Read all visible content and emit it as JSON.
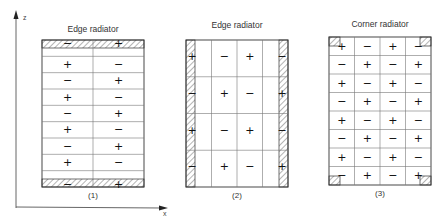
{
  "axes": {
    "z_label": "z",
    "x_label": "x"
  },
  "panels": [
    {
      "title": "Edge radiator",
      "caption": "(1)",
      "box": {
        "x": 42,
        "y": 40,
        "w": 102,
        "h": 147
      },
      "layout": "rows",
      "hatched": [
        "top",
        "bottom"
      ],
      "rows": 9,
      "cols": 2,
      "signs": [
        [
          "−",
          "+"
        ],
        [
          "+",
          "−"
        ],
        [
          "−",
          "+"
        ],
        [
          "+",
          "−"
        ],
        [
          "−",
          "+"
        ],
        [
          "+",
          "−"
        ],
        [
          "−",
          "+"
        ],
        [
          "+",
          "−"
        ],
        [
          "−",
          "+"
        ]
      ]
    },
    {
      "title": "Edge radiator",
      "caption": "(2)",
      "box": {
        "x": 186,
        "y": 40,
        "w": 102,
        "h": 147
      },
      "layout": "cols",
      "hatched": [
        "left",
        "right"
      ],
      "rows": 4,
      "cols": 4,
      "signs": [
        [
          "+",
          "−",
          "+",
          "−"
        ],
        [
          "−",
          "+",
          "−",
          "+"
        ],
        [
          "+",
          "−",
          "+",
          "−"
        ],
        [
          "−",
          "+",
          "−",
          "+"
        ]
      ]
    },
    {
      "title": "Corner radiator",
      "caption": "(3)",
      "box": {
        "x": 329,
        "y": 37,
        "w": 102,
        "h": 148
      },
      "layout": "grid",
      "hatched": [
        "top-left",
        "top-right",
        "bottom-left",
        "bottom-right"
      ],
      "rows": 8,
      "cols": 4,
      "signs": [
        [
          "+",
          "−",
          "+",
          "−"
        ],
        [
          "−",
          "+",
          "−",
          "+"
        ],
        [
          "+",
          "−",
          "+",
          "−"
        ],
        [
          "−",
          "+",
          "−",
          "+"
        ],
        [
          "+",
          "−",
          "+",
          "−"
        ],
        [
          "−",
          "+",
          "−",
          "+"
        ],
        [
          "+",
          "−",
          "+",
          "−"
        ],
        [
          "−",
          "+",
          "−",
          "+"
        ]
      ]
    }
  ]
}
